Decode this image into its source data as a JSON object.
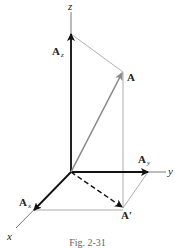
{
  "figure": {
    "caption": "Fig. 2-31",
    "axes": {
      "x_label": "x",
      "y_label": "y",
      "z_label": "z"
    },
    "vectors": {
      "A": {
        "label": "A",
        "color": "#8a8a8a"
      },
      "A_x": {
        "label": "A",
        "subscript": "x",
        "color": "#111111"
      },
      "A_y": {
        "label": "A",
        "subscript": "y",
        "color": "#111111"
      },
      "A_z": {
        "label": "A",
        "subscript": "z",
        "color": "#111111"
      },
      "A_prime": {
        "label": "A′",
        "style": "dashed",
        "color": "#111111"
      }
    },
    "colors": {
      "axis": "#555555",
      "construction_lines": "#9a9a9a",
      "component_vectors": "#111111",
      "resultant_vector": "#8a8a8a"
    }
  }
}
